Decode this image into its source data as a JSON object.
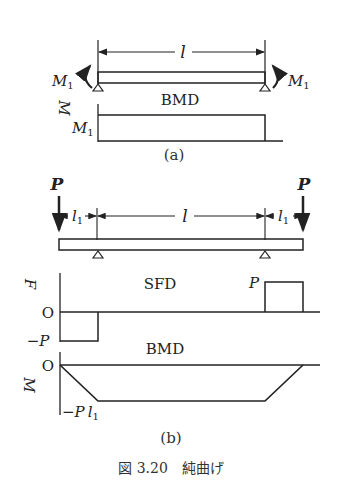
{
  "figure": {
    "caption": "図 3.20　純曲げ",
    "part_a": {
      "sublabel": "(a)",
      "span_label": "l",
      "moment_left": "M",
      "moment_left_sub": "1",
      "moment_right": "M",
      "moment_right_sub": "1",
      "bmd_title": "BMD",
      "bmd_axis": "M",
      "bmd_value": "M",
      "bmd_value_sub": "1"
    },
    "part_b": {
      "sublabel": "(b)",
      "load_left": "P",
      "load_right": "P",
      "overhang_left": "l",
      "overhang_left_sub": "1",
      "span_label": "l",
      "overhang_right": "l",
      "overhang_right_sub": "1",
      "sfd_title": "SFD",
      "sfd_axis": "F",
      "sfd_zero": "O",
      "sfd_pos": "P",
      "sfd_neg": "−P",
      "bmd_title": "BMD",
      "bmd_axis": "M",
      "bmd_zero": "O",
      "bmd_min": "−P",
      "bmd_min_l": "l",
      "bmd_min_sub": "1"
    }
  }
}
